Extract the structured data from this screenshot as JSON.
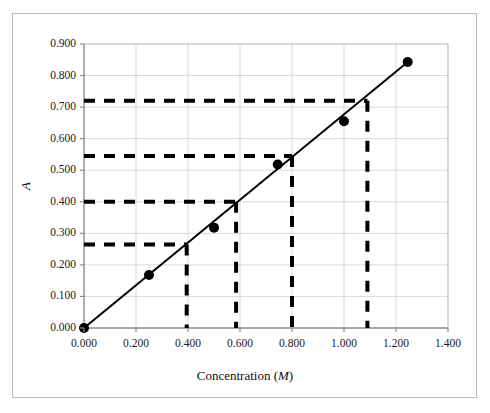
{
  "figure": {
    "background_color": "#ffffff",
    "frame_border_color": "#b9b9b9"
  },
  "chart_data": {
    "type": "scatter",
    "title": "",
    "subtitle": "",
    "xlabel": "Concentration (M)",
    "xlabel_text": "Concentration (",
    "xlabel_unit": "M",
    "xlabel_close": ")",
    "ylabel": "A",
    "xlim": [
      0.0,
      1.4
    ],
    "ylim": [
      0.0,
      0.9
    ],
    "xticks": [
      0.0,
      0.2,
      0.4,
      0.6,
      0.8,
      1.0,
      1.2,
      1.4
    ],
    "xtick_labels": [
      "0.000",
      "0.200",
      "0.400",
      "0.600",
      "0.800",
      "1.000",
      "1.200",
      "1.400"
    ],
    "yticks": [
      0.0,
      0.1,
      0.2,
      0.3,
      0.4,
      0.5,
      0.6,
      0.7,
      0.8,
      0.9
    ],
    "ytick_labels": [
      "0.000",
      "0.100",
      "0.200",
      "0.300",
      "0.400",
      "0.500",
      "0.600",
      "0.700",
      "0.800",
      "0.900"
    ],
    "grid": {
      "horizontal": true,
      "vertical": true,
      "color": "#d9d9d9"
    },
    "legend": {
      "visible": false,
      "position": "none",
      "entries": []
    },
    "series": [
      {
        "name": "Calibration standards",
        "type": "scatter",
        "marker": "filled-circle",
        "marker_color": "#000000",
        "marker_size": 7,
        "x": [
          0.0,
          0.25,
          0.5,
          0.745,
          1.0,
          1.245
        ],
        "y": [
          0.0,
          0.168,
          0.318,
          0.518,
          0.655,
          0.843
        ]
      },
      {
        "name": "Best-fit line",
        "type": "line",
        "line_color": "#000000",
        "line_width": 2,
        "line_style": "solid",
        "x": [
          0.0,
          1.245
        ],
        "y": [
          0.0,
          0.843
        ]
      }
    ],
    "annotations": {
      "style": "dashed",
      "color": "#000000",
      "line_width": 4,
      "description": "Four dashed read-off construction lines: horizontal from the A axis to the best-fit line, then vertical down to the concentration axis.",
      "readings": [
        {
          "label": "reading-1",
          "absorbance": 0.265,
          "concentration": 0.395
        },
        {
          "label": "reading-2",
          "absorbance": 0.4,
          "concentration": 0.585
        },
        {
          "label": "reading-3",
          "absorbance": 0.545,
          "concentration": 0.8
        },
        {
          "label": "reading-4",
          "absorbance": 0.72,
          "concentration": 1.09
        }
      ]
    }
  }
}
